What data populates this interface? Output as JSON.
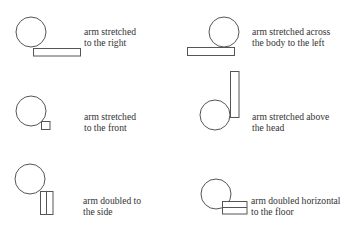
{
  "diagram": {
    "type": "pictogram-legend",
    "stroke_color": "#555555",
    "text_color": "#333333",
    "background": "#ffffff",
    "items": [
      {
        "id": "arm-stretched-right",
        "caption_lines": [
          "arm stretched",
          "to the right"
        ],
        "shapes": {
          "head": "circle",
          "arm": "horizontal-rectangle-right"
        }
      },
      {
        "id": "arm-stretched-across-left",
        "caption_lines": [
          "arm stretched across",
          "the body to the left"
        ],
        "shapes": {
          "head": "circle",
          "arm": "horizontal-rectangle-left"
        }
      },
      {
        "id": "arm-stretched-front",
        "caption_lines": [
          "arm stretched",
          "to the front"
        ],
        "shapes": {
          "head": "circle",
          "arm": "small-square"
        }
      },
      {
        "id": "arm-stretched-above-head",
        "caption_lines": [
          "arm stretched above",
          "the head"
        ],
        "shapes": {
          "head": "circle",
          "arm": "vertical-rectangle-up"
        }
      },
      {
        "id": "arm-doubled-side",
        "caption_lines": [
          "arm doubled to",
          "the side"
        ],
        "shapes": {
          "head": "circle",
          "arm": "vertical-double-rectangle"
        }
      },
      {
        "id": "arm-doubled-horizontal-floor",
        "caption_lines": [
          "arm doubled horizontal",
          "to the floor"
        ],
        "shapes": {
          "head": "circle",
          "arm": "horizontal-double-rectangle"
        }
      }
    ]
  }
}
